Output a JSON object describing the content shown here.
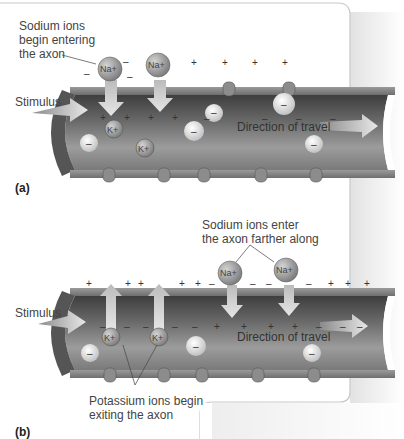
{
  "panel_a": {
    "label": "(a)",
    "callout_sodium": [
      "Sodium ions",
      "begin entering",
      "the axon"
    ],
    "stimulus": "Stimulus",
    "direction": "Direction of travel",
    "na_ion": "Na+",
    "k_ion": "K+",
    "neg_ion": "–"
  },
  "panel_b": {
    "label": "(b)",
    "callout_sodium": [
      "Sodium ions enter",
      "the axon farther along"
    ],
    "callout_potassium": [
      "Potassium ions begin",
      "exiting the axon"
    ],
    "stimulus": "Stimulus",
    "direction": "Direction of travel",
    "na_ion": "Na+",
    "k_ion": "K+",
    "neg_ion": "–"
  },
  "colors": {
    "axon_dark": "#4a4a4a",
    "axon_mid": "#8a8a8a",
    "axon_light": "#b8b8b8",
    "ion": "#9a9a9a",
    "arrow": "#d8d8d8"
  }
}
